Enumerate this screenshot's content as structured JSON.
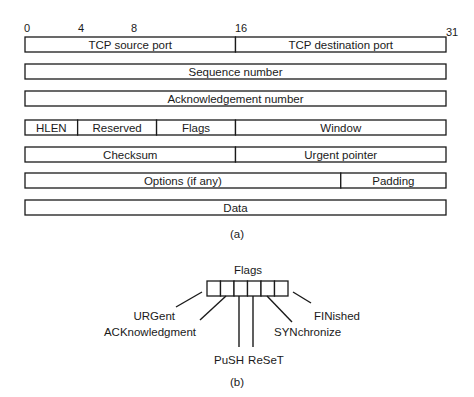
{
  "figure_a": {
    "caption": "(a)",
    "bit_labels": [
      "0",
      "4",
      "8",
      "16",
      "31"
    ],
    "rows": [
      [
        {
          "label": "TCP source port",
          "from_bit": 0,
          "to_bit": 16
        },
        {
          "label": "TCP destination port",
          "from_bit": 16,
          "to_bit": 32
        }
      ],
      [
        {
          "label": "Sequence number",
          "from_bit": 0,
          "to_bit": 32
        }
      ],
      [
        {
          "label": "Acknowledgement number",
          "from_bit": 0,
          "to_bit": 32
        }
      ],
      [
        {
          "label": "HLEN",
          "from_bit": 0,
          "to_bit": 4
        },
        {
          "label": "Reserved",
          "from_bit": 4,
          "to_bit": 10
        },
        {
          "label": "Flags",
          "from_bit": 10,
          "to_bit": 16
        },
        {
          "label": "Window",
          "from_bit": 16,
          "to_bit": 32
        }
      ],
      [
        {
          "label": "Checksum",
          "from_bit": 0,
          "to_bit": 16
        },
        {
          "label": "Urgent pointer",
          "from_bit": 16,
          "to_bit": 32
        }
      ],
      [
        {
          "label": "Options (if any)",
          "from_bit": 0,
          "to_bit": 24
        },
        {
          "label": "Padding",
          "from_bit": 24,
          "to_bit": 32
        }
      ],
      [
        {
          "label": "Data",
          "from_bit": 0,
          "to_bit": 32
        }
      ]
    ]
  },
  "figure_b": {
    "caption": "(b)",
    "title": "Flags",
    "flags": [
      "URGent",
      "ACKnowledgment",
      "PuSH",
      "ReSeT",
      "SYNchronize",
      "FINished"
    ]
  }
}
